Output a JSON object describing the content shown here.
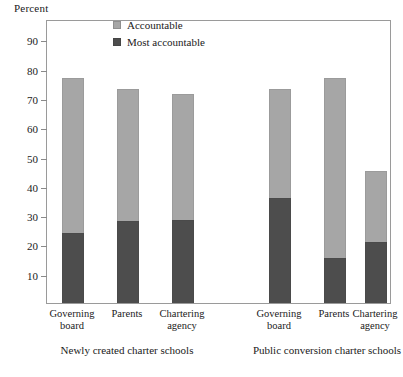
{
  "chart_data": {
    "type": "bar",
    "title": "",
    "subtitle": "",
    "xlabel": "",
    "ylabel": "Percent",
    "ylim": [
      0,
      97
    ],
    "yticks": [
      10,
      20,
      30,
      40,
      50,
      60,
      70,
      80,
      90
    ],
    "grid": false,
    "legend_position": "top-center",
    "stacked": true,
    "categories": [
      "Governing board",
      "Parents",
      "Chartering agency",
      "Governing board",
      "Parents",
      "Chartering agency"
    ],
    "category_lines": [
      [
        "Governing",
        "board"
      ],
      [
        "Parents",
        ""
      ],
      [
        "Chartering",
        "agency"
      ],
      [
        "Governing",
        "board"
      ],
      [
        "Parents",
        ""
      ],
      [
        "Chartering",
        "agency"
      ]
    ],
    "groups": [
      {
        "label": "Newly created charter schools",
        "categories": [
          0,
          1,
          2
        ]
      },
      {
        "label": "Public conversion charter schools",
        "categories": [
          3,
          4,
          5
        ]
      }
    ],
    "series": [
      {
        "name": "Most accountable",
        "color": "#4d4d4d",
        "values": [
          24,
          28,
          28.5,
          36,
          15.5,
          21
        ]
      },
      {
        "name": "Accountable",
        "color": "#a6a6a6",
        "values": [
          53,
          45,
          43,
          37,
          61.5,
          24
        ]
      }
    ],
    "totals": [
      77,
      73,
      71.5,
      73,
      77,
      45
    ]
  },
  "legend": {
    "items": [
      {
        "label": "Accountable",
        "color": "#a6a6a6"
      },
      {
        "label": "Most accountable",
        "color": "#4d4d4d"
      }
    ]
  }
}
